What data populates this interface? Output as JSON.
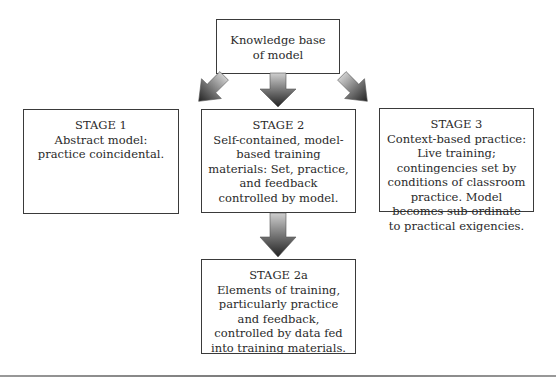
{
  "diagram": {
    "root": {
      "lines": [
        "Knowledge base",
        "of model"
      ]
    },
    "stages": {
      "stage1": {
        "title": "STAGE 1",
        "body": "Abstract model: practice coincidental."
      },
      "stage2": {
        "title": "STAGE 2",
        "body": "Self-contained, model-based training materials: Set, practice, and feedback controlled by model."
      },
      "stage3": {
        "title": "STAGE 3",
        "body": "Context-based practice: Live training; contingencies set by conditions of classroom practice. Model becomes sub-ordinate to practical exigencies."
      },
      "stage2a": {
        "title": "STAGE 2a",
        "body": "Elements of training, particularly practice and feedback, controlled by data fed into training materials."
      }
    },
    "arrows": [
      {
        "from": "root",
        "to": "stage1",
        "direction": "down-left"
      },
      {
        "from": "root",
        "to": "stage2",
        "direction": "down"
      },
      {
        "from": "root",
        "to": "stage3",
        "direction": "down-right"
      },
      {
        "from": "stage2",
        "to": "stage2a",
        "direction": "down"
      }
    ],
    "colors": {
      "arrow_dark": "#2b2b2b",
      "arrow_light": "#c8c8c8",
      "border": "#3a3a3a"
    }
  }
}
